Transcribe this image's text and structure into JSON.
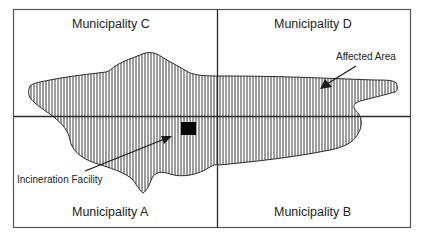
{
  "diagram": {
    "municipalities": [
      {
        "id": "C",
        "label": "Municipality C",
        "quadrant": "top-left"
      },
      {
        "id": "D",
        "label": "Municipality D",
        "quadrant": "top-right"
      },
      {
        "id": "A",
        "label": "Municipality A",
        "quadrant": "bottom-left"
      },
      {
        "id": "B",
        "label": "Municipality B",
        "quadrant": "bottom-right"
      }
    ],
    "callouts": {
      "affected_area": "Affected Area",
      "incineration_facility": "Incineration Facility"
    },
    "colors": {
      "line": "#2a2a2a",
      "hatch": "#3a3a3a",
      "facility": "#000000",
      "background": "#ffffff"
    }
  }
}
